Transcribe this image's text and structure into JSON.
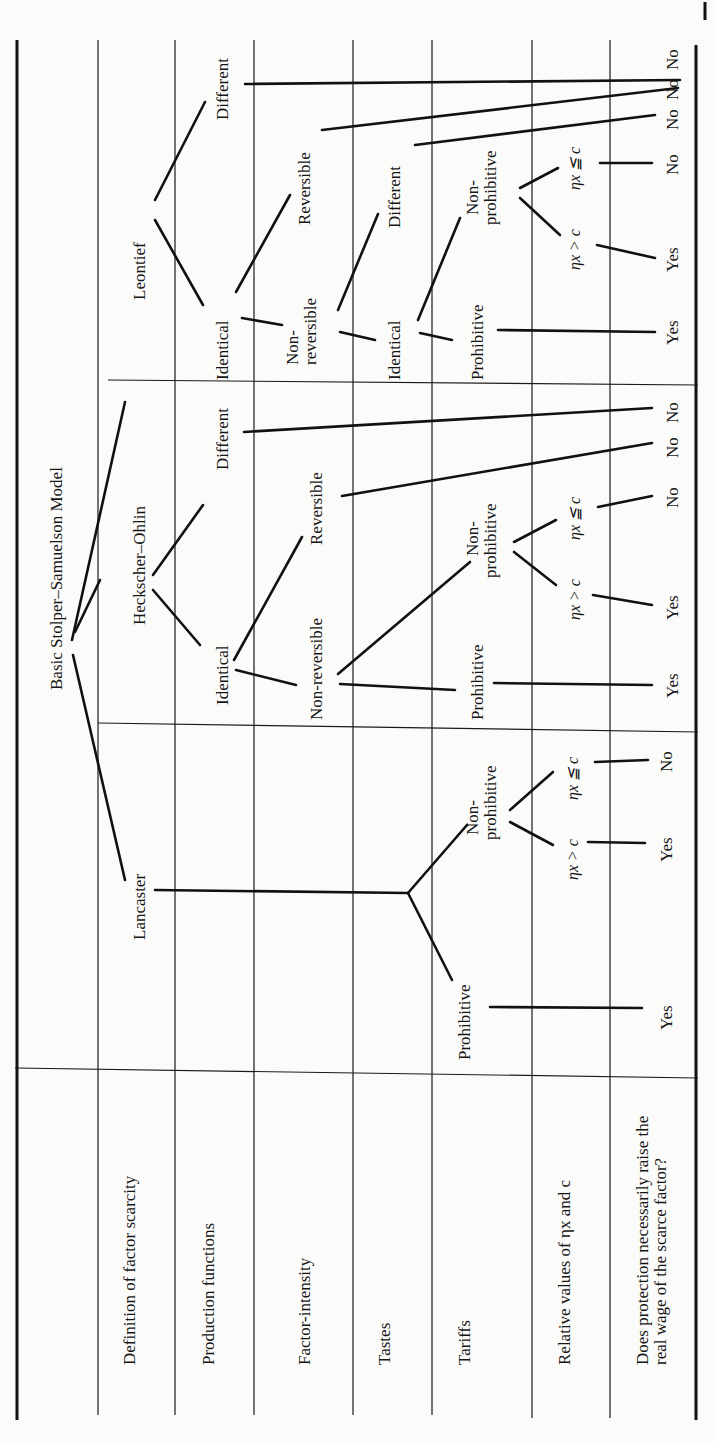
{
  "row_labels": {
    "definition": "Definition of factor scarcity",
    "production": "Production functions",
    "intensity": "Factor-intensity",
    "tastes": "Tastes",
    "tariffs": "Tariffs",
    "relative": "Relative values of ηx and c",
    "question_line1": "Does protection necessarily raise the",
    "question_line2": "real wage of the scarce factor?"
  },
  "root": "Basic Stolper–Samuelson Model",
  "leontief": {
    "label": "Leontief",
    "identical": "Identical",
    "different": "Different",
    "non_reversible_1": "Non-",
    "non_reversible_2": "reversible",
    "reversible": "Reversible",
    "tastes_identical": "Identical",
    "tastes_different": "Different",
    "prohibitive": "Prohibitive",
    "non_prohibitive_1": "Non-",
    "non_prohibitive_2": "prohibitive",
    "gt": "ηx > c",
    "le": "ηx ≦ c",
    "answers": [
      "Yes",
      "Yes",
      "No",
      "No",
      "No",
      "No"
    ]
  },
  "heckscher_ohlin": {
    "label": "Heckscher–Ohlin",
    "identical": "Identical",
    "different": "Different",
    "non_reversible": "Non-reversible",
    "reversible": "Reversible",
    "prohibitive": "Prohibitive",
    "non_prohibitive_1": "Non-",
    "non_prohibitive_2": "prohibitive",
    "gt": "ηx > c",
    "le": "ηx ≦ c",
    "answers": [
      "Yes",
      "Yes",
      "No",
      "No",
      "No"
    ]
  },
  "lancaster": {
    "label": "Lancaster",
    "prohibitive": "Prohibitive",
    "non_prohibitive_1": "Non-",
    "non_prohibitive_2": "prohibitive",
    "gt": "ηx > c",
    "le": "ηx ≦ c",
    "answers": [
      "Yes",
      "Yes",
      "No"
    ]
  }
}
